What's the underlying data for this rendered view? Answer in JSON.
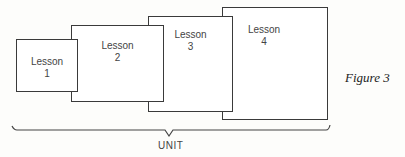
{
  "diagram": {
    "boxes": [
      {
        "title": "Lesson",
        "number": "1"
      },
      {
        "title": "Lesson",
        "number": "2"
      },
      {
        "title": "Lesson",
        "number": "3"
      },
      {
        "title": "Lesson",
        "number": "4"
      }
    ],
    "brace_label": "UNIT",
    "caption": "Figure 3"
  }
}
